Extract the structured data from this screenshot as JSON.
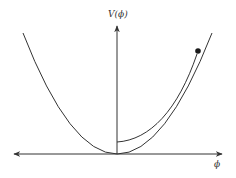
{
  "diagram": {
    "title": "",
    "axes": {
      "y_label": "V(ϕ)",
      "x_label": "ϕ",
      "line_color": "#333333"
    },
    "curves": {
      "potential": "V(ϕ) parabola",
      "trajectory": "field rolling down potential"
    },
    "marker": {
      "kind": "filled-dot",
      "color": "#1a1a1a"
    }
  }
}
